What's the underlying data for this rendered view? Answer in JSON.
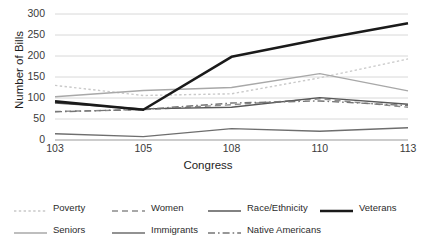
{
  "chart_data": {
    "type": "line",
    "title": "",
    "xlabel": "Congress",
    "ylabel": "Number of Bills",
    "categories": [
      "103",
      "105",
      "108",
      "110",
      "113"
    ],
    "ylim": [
      0,
      300
    ],
    "yticks": [
      0,
      50,
      100,
      150,
      200,
      250,
      300
    ],
    "grid": true,
    "legend_position": "bottom",
    "series": [
      {
        "name": "Poverty",
        "values": [
          130,
          106,
          110,
          148,
          193
        ],
        "color": "#c9c9c9",
        "style": "dotted",
        "width": 1.4
      },
      {
        "name": "Seniors",
        "values": [
          103,
          118,
          125,
          158,
          117
        ],
        "color": "#a8a8a8",
        "style": "solid",
        "width": 1.4
      },
      {
        "name": "Women",
        "values": [
          68,
          72,
          84,
          98,
          78
        ],
        "color": "#8c8c8c",
        "style": "dashed",
        "width": 1.4
      },
      {
        "name": "Immigrants",
        "values": [
          15,
          8,
          27,
          21,
          29
        ],
        "color": "#6e6e6e",
        "style": "solid",
        "width": 1.4
      },
      {
        "name": "Race/Ethnicity",
        "values": [
          88,
          74,
          78,
          101,
          85
        ],
        "color": "#585858",
        "style": "solid",
        "width": 1.4
      },
      {
        "name": "Native Americans",
        "values": [
          67,
          73,
          88,
          93,
          82
        ],
        "color": "#757575",
        "style": "dashdot",
        "width": 1.4
      },
      {
        "name": "Veterans",
        "values": [
          92,
          72,
          198,
          240,
          278
        ],
        "color": "#1a1a1a",
        "style": "solid",
        "width": 2.6
      }
    ]
  },
  "axis": {
    "y_title": "Number of Bills",
    "x_title": "Congress",
    "y_tick_labels": [
      "300",
      "250",
      "200",
      "150",
      "100",
      "50",
      "0"
    ],
    "x_tick_labels": [
      "103",
      "105",
      "108",
      "110",
      "113"
    ]
  },
  "legend": {
    "items": [
      {
        "label": "Poverty",
        "row": 0,
        "col": 0
      },
      {
        "label": "Women",
        "row": 0,
        "col": 1
      },
      {
        "label": "Race/Ethnicity",
        "row": 0,
        "col": 2
      },
      {
        "label": "Veterans",
        "row": 0,
        "col": 3
      },
      {
        "label": "Seniors",
        "row": 1,
        "col": 0
      },
      {
        "label": "Immigrants",
        "row": 1,
        "col": 1
      },
      {
        "label": "Native Americans",
        "row": 1,
        "col": 2
      }
    ]
  },
  "style": {
    "grid_color": "#d4d4d4",
    "axis_color": "#9a9a9a",
    "text_color": "#2b2b2b",
    "background": "#ffffff"
  }
}
